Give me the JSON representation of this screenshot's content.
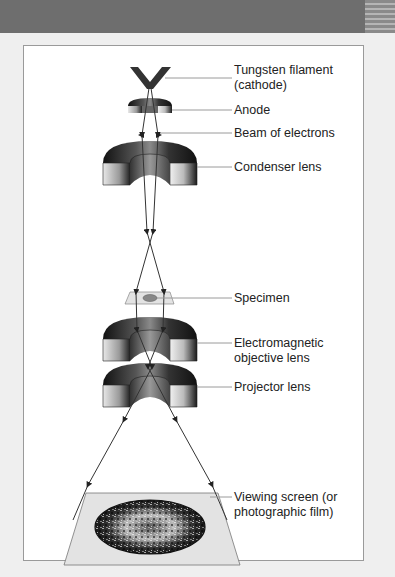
{
  "figure": {
    "labels": [
      {
        "id": "filament",
        "line1": "Tungsten filament",
        "line2": "(cathode)"
      },
      {
        "id": "anode",
        "line1": "Anode",
        "line2": ""
      },
      {
        "id": "beam",
        "line1": "Beam of electrons",
        "line2": ""
      },
      {
        "id": "condenser",
        "line1": "Condenser lens",
        "line2": ""
      },
      {
        "id": "specimen",
        "line1": "Specimen",
        "line2": ""
      },
      {
        "id": "objective",
        "line1": "Electromagnetic",
        "line2": "objective lens"
      },
      {
        "id": "projector",
        "line1": "Projector lens",
        "line2": ""
      },
      {
        "id": "screen",
        "line1": "Viewing screen (or",
        "line2": "photographic film)"
      }
    ]
  },
  "colors": {
    "background": "#efefef",
    "panel": "#ffffff",
    "lens_dark": "#1a1a1a",
    "lens_mid": "#7a7a7a",
    "lens_light": "#d8d8d8",
    "leader_line": "#9a9a9a",
    "specimen_plate": "#e3e3e3",
    "beam": "#333333"
  }
}
